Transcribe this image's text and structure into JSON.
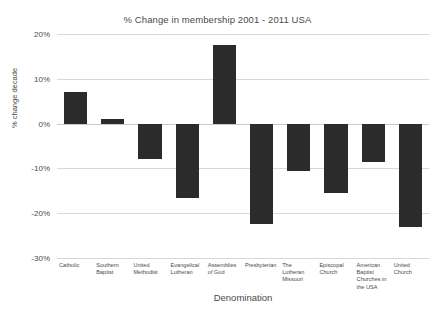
{
  "chart_data": {
    "type": "bar",
    "title": "% Change in membership 2001 - 2011 USA",
    "xlabel": "Denomination",
    "ylabel": "% change decade",
    "ylim": [
      -30,
      20
    ],
    "grid": true,
    "legend": "none",
    "yticks": [
      "20%",
      "10%",
      "0%",
      "-10%",
      "-20%",
      "-30%"
    ],
    "ytick_values": [
      20,
      10,
      0,
      -10,
      -20,
      -30
    ],
    "categories": [
      "Catholic",
      "Southern Baptist",
      "United Methodist",
      "Evangelical Lutheran",
      "Assemblies of God",
      "Presbyterian",
      "The Lutheran Missouri",
      "Episcopal Church",
      "American Baptist Churches in the USA",
      "United Church"
    ],
    "values": [
      7,
      1,
      -8,
      -16.5,
      17.5,
      -22.5,
      -10.5,
      -15.5,
      -8.5,
      -23
    ],
    "bar_color": "#2b2b2b",
    "grid_color": "#d8d8d8",
    "background_color": "#ffffff",
    "text_color": "#4a4a4a"
  }
}
